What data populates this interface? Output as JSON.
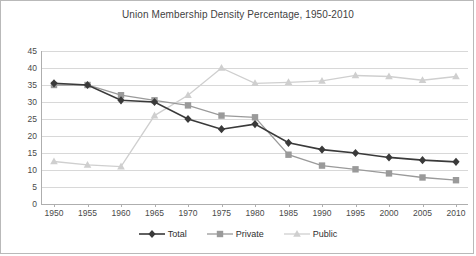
{
  "chart_data": {
    "type": "line",
    "title": "Union Membership Density Percentage, 1950-2010",
    "xlabel": "",
    "ylabel": "",
    "categories": [
      "1950",
      "1955",
      "1960",
      "1965",
      "1970",
      "1975",
      "1980",
      "1985",
      "1990",
      "1995",
      "2000",
      "2005",
      "2010"
    ],
    "ylim": [
      0,
      45
    ],
    "yticks": [
      "0",
      "5",
      "10",
      "15",
      "20",
      "25",
      "30",
      "35",
      "40",
      "45"
    ],
    "grid": true,
    "legend_position": "bottom",
    "series": [
      {
        "name": "Total",
        "color": "#3a3a3a",
        "marker": "diamond",
        "values": [
          35.5,
          35,
          30.5,
          30,
          25,
          22,
          23.5,
          18,
          16,
          15,
          13.7,
          12.9,
          12.4
        ]
      },
      {
        "name": "Private",
        "color": "#9a9a9a",
        "marker": "square",
        "values": [
          35,
          35,
          32,
          30.5,
          29,
          26,
          25.5,
          14.5,
          11.3,
          10.2,
          9,
          7.8,
          7
        ]
      },
      {
        "name": "Public",
        "color": "#cfcfcf",
        "marker": "triangle",
        "values": [
          12.5,
          11.5,
          11,
          26,
          32,
          40,
          35.5,
          35.8,
          36.2,
          37.8,
          37.5,
          36.4,
          37.5
        ]
      }
    ]
  },
  "legend": {
    "items": [
      {
        "label": "Total"
      },
      {
        "label": "Private"
      },
      {
        "label": "Public"
      }
    ]
  },
  "axis": {
    "y_tick_labels": [
      "0",
      "5",
      "10",
      "15",
      "20",
      "25",
      "30",
      "35",
      "40",
      "45"
    ],
    "x_tick_labels": [
      "1950",
      "1955",
      "1960",
      "1965",
      "1970",
      "1975",
      "1980",
      "1985",
      "1990",
      "1995",
      "2000",
      "2005",
      "2010"
    ]
  }
}
